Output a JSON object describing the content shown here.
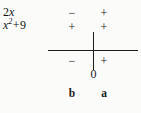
{
  "chart_data": {
    "type": "table",
    "title": "",
    "row_labels": [
      "2x",
      "x² + 9"
    ],
    "row_label_parts": [
      {
        "coefficient": "2",
        "variable": "x",
        "exponent": "",
        "operator": "",
        "constant": ""
      },
      {
        "coefficient": "",
        "variable": "x",
        "exponent": "2",
        "operator": "+",
        "constant": "9"
      }
    ],
    "columns": [
      {
        "id": "left",
        "interval_point_label": "b"
      },
      {
        "id": "right",
        "interval_point_label": "a"
      }
    ],
    "signs": {
      "2x": [
        "−",
        "+"
      ],
      "x^2+9": [
        "+",
        "+"
      ],
      "product": [
        "−",
        "+"
      ]
    },
    "axis": {
      "origin_label": "0",
      "tick_values": [
        "0"
      ],
      "grid": false,
      "orientation": "horizontal"
    },
    "colors": {
      "background": "#fbfbfa",
      "ink": "#1a1a1a",
      "axis": "#1d1d1d"
    }
  },
  "labels": {
    "expr_row1": {
      "coefficient": "2",
      "variable": "x"
    },
    "expr_row2": {
      "variable": "x",
      "exponent": "2",
      "operator": "+",
      "constant": "9"
    },
    "signs": {
      "r1c1": "−",
      "r1c2": "+",
      "r2c1": "+",
      "r2c2": "+",
      "r3c1": "−",
      "r3c2": "+"
    },
    "origin": "0",
    "point_b": "b",
    "point_a": "a"
  }
}
